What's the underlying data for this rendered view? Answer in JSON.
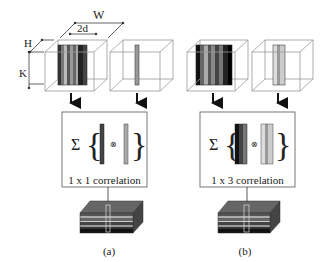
{
  "dimensions": {
    "W": "W",
    "two_d": "2d",
    "H": "H",
    "K": "K"
  },
  "panels": [
    {
      "id": "a",
      "caption": "(a)",
      "correlation_label": "1 x 1 correlation",
      "sum_symbol": "Σ",
      "operator_symbol": "⊗"
    },
    {
      "id": "b",
      "caption": "(b)",
      "correlation_label": "1 x 3 correlation",
      "sum_symbol": "Σ",
      "operator_symbol": "⊗"
    }
  ],
  "colors": {
    "cube_edge": "#9a9a9a",
    "arrow": "#111111",
    "box_border": "#555555",
    "text": "#222222"
  }
}
